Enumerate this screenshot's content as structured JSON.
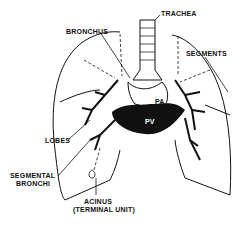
{
  "diagram": {
    "labels": {
      "trachea": "TRACHEA",
      "bronchus": "BRONCHUS",
      "segments": "SEGMENTS",
      "lobes": "LOBES",
      "segmental_bronchi_line1": "SEGMENTAL",
      "segmental_bronchi_line2": "BRONCHI",
      "acinus_line1": "ACINUS",
      "acinus_line2": "(TERMINAL UNIT)",
      "pa": "PA",
      "pv": "PV"
    },
    "colors": {
      "ink": "#111111",
      "background": "#ffffff"
    }
  }
}
